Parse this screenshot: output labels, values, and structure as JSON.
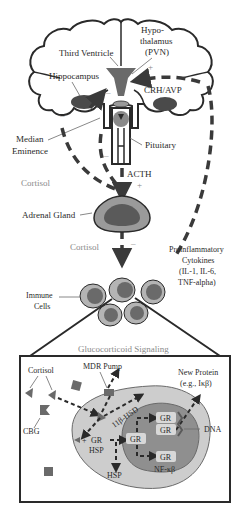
{
  "colors": {
    "dark_grey": "#5a5a5a",
    "mid_grey": "#8c8c8c",
    "light_grey": "#bdbdbd",
    "nucleus_grey": "#8f8f8f",
    "cell_fill": "#c8c8c8",
    "line": "#2a2a2a"
  },
  "brain": {
    "third_ventricle": "Third Ventricle",
    "hypothalamus_line1": "Hypo-",
    "hypothalamus_line2": "thalamus",
    "hypothalamus_line3": "(PVN)",
    "hippocampus": "Hippocampus",
    "crh_avp": "CRH/AVP",
    "median_eminence_line1": "Median",
    "median_eminence_line2": "Eminence",
    "pituitary": "Pituitary",
    "plus_sign": "+",
    "minus_sign": "–"
  },
  "axis": {
    "acth": "ACTH",
    "acth_sign": "+",
    "cortisol_left": "Cortisol",
    "adrenal_gland": "Adrenal Gland",
    "cortisol_down": "Cortisol",
    "cortisol_down_sign": "–",
    "cytokines_line1": "Proinflammatory",
    "cytokines_line2": "Cytokines",
    "cytokines_line3": "(IL-1, IL-6,",
    "cytokines_line4": "TNF-alpha)",
    "immune_cells_line1": "Immune",
    "immune_cells_line2": "Cells"
  },
  "signaling": {
    "title": "Glucocorticoid Signaling",
    "cortisol": "Cortisol",
    "mdr_pump": "MDR Pump",
    "new_protein_line1": "New Protein",
    "new_protein_line2": "(e.g., Iκβ)",
    "cbg": "CBG",
    "hsd": "11β-HSD",
    "gr": "GR",
    "hsp": "HSP",
    "dna": "DNA",
    "nfkb": "NF-κβ",
    "plus": "+"
  }
}
